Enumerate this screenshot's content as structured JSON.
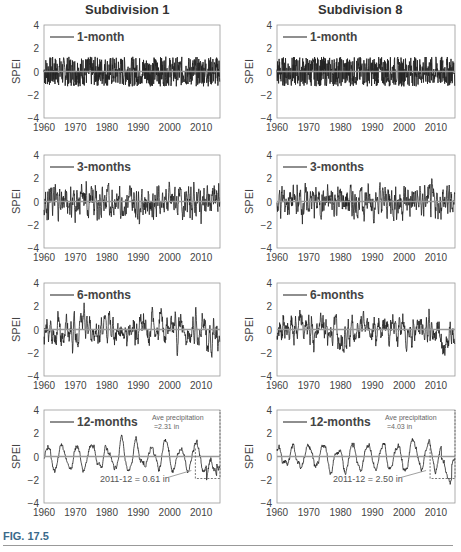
{
  "figure": {
    "label": "FIG. 17.5",
    "columns": [
      "Subdivision 1",
      "Subdivision 8"
    ]
  },
  "chart_data": [
    {
      "type": "line",
      "title": "Subdivision 1",
      "legend": "1-month",
      "ylabel": "SPEI",
      "ylim": [
        -4,
        4
      ],
      "yticks": [
        4,
        2,
        0,
        -2,
        -4
      ],
      "xticks": [
        1960,
        1970,
        1980,
        1990,
        2000,
        2010
      ],
      "xlim": [
        1960,
        2016
      ]
    },
    {
      "type": "line",
      "title": "Subdivision 8",
      "legend": "1-month",
      "ylabel": "SPEI",
      "ylim": [
        -4,
        4
      ]
    },
    {
      "type": "line",
      "legend": "3-months",
      "ylabel": "SPEI",
      "subdivision": "Subdivision 1"
    },
    {
      "type": "line",
      "legend": "3-months",
      "ylabel": "SPEI",
      "subdivision": "Subdivision 8"
    },
    {
      "type": "line",
      "legend": "6-months",
      "ylabel": "SPEI",
      "subdivision": "Subdivision 1"
    },
    {
      "type": "line",
      "legend": "6-months",
      "ylabel": "SPEI",
      "subdivision": "Subdivision 8"
    },
    {
      "type": "line",
      "legend": "12-months",
      "ylabel": "SPEI",
      "subdivision": "Subdivision 1",
      "annotations": [
        "Ave precipitation =2.31 in",
        "2011-12 = 0.61 in"
      ]
    },
    {
      "type": "line",
      "legend": "12-months",
      "ylabel": "SPEI",
      "subdivision": "Subdivision 8",
      "annotations": [
        "Ave precipitation =4.03 in",
        "2011-12 = 2.50 in"
      ]
    }
  ],
  "legends": [
    "1-month",
    "3-months",
    "6-months",
    "12-months"
  ],
  "ylabel": "SPEI",
  "yticks": [
    "4",
    "2",
    "0",
    "−2",
    "−4"
  ],
  "xticks": [
    "1960",
    "1970",
    "1980",
    "1990",
    "2000",
    "2010"
  ],
  "annot": {
    "left_ave": "Ave precipitation",
    "left_ave2": "=2.31 in",
    "left_low": "2011-12 = 0.61 in",
    "right_ave": "Ave precipitation",
    "right_ave2": "=4.03 in",
    "right_low": "2011-12 = 2.50 in"
  }
}
